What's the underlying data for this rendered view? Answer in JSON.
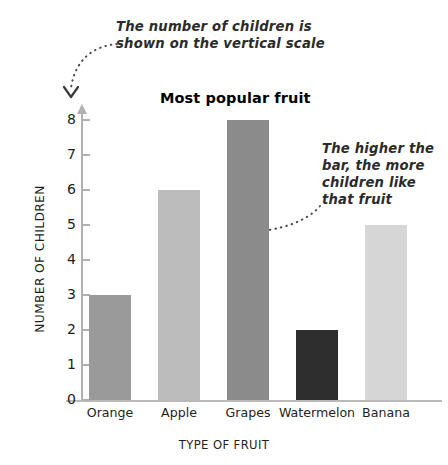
{
  "chart_data": {
    "type": "bar",
    "title": "Most popular fruit",
    "xlabel": "TYPE OF FRUIT",
    "ylabel": "NUMBER OF CHILDREN",
    "categories": [
      "Orange",
      "Apple",
      "Grapes",
      "Watermelon",
      "Banana"
    ],
    "values": [
      3,
      6,
      8,
      2,
      5
    ],
    "ylim": [
      0,
      8
    ],
    "yticks": [
      0,
      1,
      2,
      3,
      4,
      5,
      6,
      7,
      8
    ],
    "ytick_labels": [
      "0",
      "1",
      "2",
      "3",
      "4",
      "5",
      "6",
      "7",
      "8"
    ],
    "grid": false,
    "legend": "none",
    "bar_colors": [
      "#9a9a9a",
      "#bcbcbc",
      "#8b8b8b",
      "#2e2e2e",
      "#d6d6d6"
    ],
    "axis_color": "#b3b3b3",
    "annotations": [
      {
        "name": "vertical-scale-note",
        "text": "The number of children is shown on the vertical scale",
        "points_to": "y-axis"
      },
      {
        "name": "bar-height-note",
        "text": "The higher the bar, the more children like that fruit",
        "points_to": "grapes-bar"
      }
    ]
  },
  "annotations": {
    "top": {
      "line1": "The number of children is",
      "line2": "shown on the vertical scale"
    },
    "right": {
      "line1": "The higher the",
      "line2": "bar, the more",
      "line3": "children like",
      "line4": "that fruit"
    }
  }
}
